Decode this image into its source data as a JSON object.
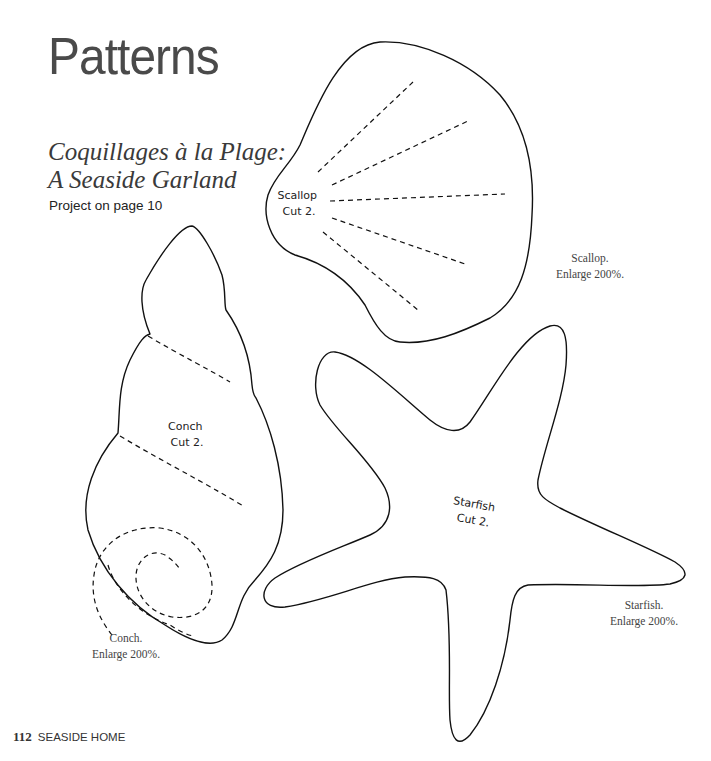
{
  "header": {
    "title": "Patterns",
    "subtitle_line1": "Coquillages à la Plage:",
    "subtitle_line2": "A Seaside Garland",
    "project_ref": "Project on page 10"
  },
  "patterns": {
    "scallop": {
      "label_line1": "Scallop",
      "label_line2": "Cut 2.",
      "caption_line1": "Scallop.",
      "caption_line2": "Enlarge 200%."
    },
    "conch": {
      "label_line1": "Conch",
      "label_line2": "Cut 2.",
      "caption_line1": "Conch.",
      "caption_line2": "Enlarge 200%."
    },
    "starfish": {
      "label_line1": "Starfish",
      "label_line2": "Cut 2.",
      "caption_line1": "Starfish.",
      "caption_line2": "Enlarge 200%."
    }
  },
  "footer": {
    "page_number": "112",
    "book_title": "SEASIDE HOME"
  },
  "colors": {
    "outline": "#111111",
    "text": "#333333",
    "background": "#ffffff"
  }
}
